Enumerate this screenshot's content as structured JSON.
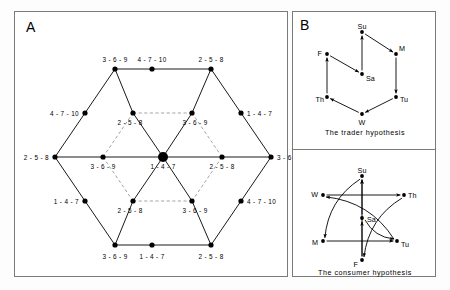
{
  "figure": {
    "panels": [
      {
        "letter": "A",
        "name": "market-ring-network"
      },
      {
        "letter": "B",
        "name": "weekday-cycle-hypotheses"
      }
    ]
  },
  "panelA": {
    "letter": "A",
    "nodes": [
      {
        "id": "n-top-left",
        "x": 100,
        "y": 57,
        "label": "3 - 6 - 9",
        "size": "small",
        "lx": 100,
        "ly": 44,
        "align": "c"
      },
      {
        "id": "n-top-mid",
        "x": 137,
        "y": 57,
        "label": "4 - 7 - 10",
        "size": "small",
        "lx": 137,
        "ly": 44,
        "align": "c"
      },
      {
        "id": "n-top-right",
        "x": 196,
        "y": 57,
        "label": "2 - 5 - 8",
        "size": "small",
        "lx": 196,
        "ly": 44,
        "align": "c"
      },
      {
        "id": "n-upper-left-mid",
        "x": 70,
        "y": 101,
        "label": "4 - 7 - 10",
        "size": "small",
        "lx": 64,
        "ly": 98,
        "align": "r"
      },
      {
        "id": "n-upper-right-mid",
        "x": 226,
        "y": 101,
        "label": "1 - 4 - 7",
        "size": "small",
        "lx": 232,
        "ly": 98,
        "align": "l"
      },
      {
        "id": "n-left",
        "x": 40,
        "y": 145,
        "label": "2 - 5 - 8",
        "size": "small",
        "lx": 34,
        "ly": 142,
        "align": "r"
      },
      {
        "id": "n-right",
        "x": 256,
        "y": 145,
        "label": "3 - 6 - 9",
        "size": "small",
        "lx": 262,
        "ly": 142,
        "align": "l"
      },
      {
        "id": "n-lower-left-mid",
        "x": 70,
        "y": 189,
        "label": "1 - 4 - 7",
        "size": "small",
        "lx": 64,
        "ly": 186,
        "align": "r"
      },
      {
        "id": "n-lower-right-mid",
        "x": 226,
        "y": 189,
        "label": "4 - 7 - 10",
        "size": "small",
        "lx": 232,
        "ly": 186,
        "align": "l"
      },
      {
        "id": "n-bot-left",
        "x": 100,
        "y": 233,
        "label": "3 - 6 - 9",
        "size": "small",
        "lx": 100,
        "ly": 241,
        "align": "c"
      },
      {
        "id": "n-bot-mid",
        "x": 137,
        "y": 233,
        "label": "1 - 4 - 7",
        "size": "small",
        "lx": 137,
        "ly": 241,
        "align": "c"
      },
      {
        "id": "n-bot-right",
        "x": 196,
        "y": 233,
        "label": "2 - 5 - 8",
        "size": "small",
        "lx": 196,
        "ly": 241,
        "align": "c"
      },
      {
        "id": "n-inner-top-left",
        "x": 118,
        "y": 101,
        "label": "2 - 5 - 8",
        "size": "small",
        "lx": 115,
        "ly": 107,
        "align": "c"
      },
      {
        "id": "n-inner-top-right",
        "x": 177,
        "y": 101,
        "label": "3 - 6 - 9",
        "size": "small",
        "lx": 180,
        "ly": 107,
        "align": "c"
      },
      {
        "id": "n-mid-left",
        "x": 88,
        "y": 145,
        "label": "3 - 6 - 9",
        "size": "small",
        "lx": 88,
        "ly": 151,
        "align": "c"
      },
      {
        "id": "n-center",
        "x": 148,
        "y": 145,
        "label": "1 - 4 - 7",
        "size": "large",
        "lx": 148,
        "ly": 151,
        "align": "c"
      },
      {
        "id": "n-mid-right",
        "x": 207,
        "y": 145,
        "label": "2 - 5 - 8",
        "size": "small",
        "lx": 207,
        "ly": 151,
        "align": "c"
      },
      {
        "id": "n-inner-bot-left",
        "x": 118,
        "y": 189,
        "label": "2 - 5 - 8",
        "size": "small",
        "lx": 115,
        "ly": 195,
        "align": "c"
      },
      {
        "id": "n-inner-bot-right",
        "x": 177,
        "y": 189,
        "label": "3 - 6 - 9",
        "size": "small",
        "lx": 180,
        "ly": 195,
        "align": "c"
      }
    ],
    "solid_edges": [
      [
        100,
        57,
        196,
        57
      ],
      [
        40,
        145,
        100,
        233
      ],
      [
        40,
        145,
        100,
        57
      ],
      [
        256,
        145,
        196,
        57
      ],
      [
        256,
        145,
        196,
        233
      ],
      [
        100,
        233,
        196,
        233
      ],
      [
        100,
        57,
        118,
        101
      ],
      [
        118,
        101,
        148,
        145
      ],
      [
        148,
        145,
        177,
        101
      ],
      [
        177,
        101,
        196,
        57
      ],
      [
        100,
        233,
        118,
        189
      ],
      [
        118,
        189,
        148,
        145
      ],
      [
        148,
        145,
        177,
        189
      ],
      [
        177,
        189,
        196,
        233
      ],
      [
        88,
        145,
        256,
        145
      ],
      [
        40,
        145,
        88,
        145
      ]
    ],
    "dashed_edges": [
      [
        118,
        101,
        177,
        101
      ],
      [
        118,
        189,
        177,
        189
      ],
      [
        88,
        145,
        118,
        101
      ],
      [
        88,
        145,
        118,
        189
      ],
      [
        207,
        145,
        177,
        101
      ],
      [
        207,
        145,
        177,
        189
      ]
    ]
  },
  "panelB": {
    "letter": "B",
    "trader": {
      "caption": "The trader hypothesis",
      "nodes": [
        {
          "id": "su",
          "label": "Su",
          "x": 69,
          "y": 20,
          "lx": 69,
          "ly": 11,
          "align": "c"
        },
        {
          "id": "m",
          "label": "M",
          "x": 103,
          "y": 42,
          "lx": 106,
          "ly": 33,
          "align": "l"
        },
        {
          "id": "tu",
          "label": "Tu",
          "x": 103,
          "y": 85,
          "lx": 107,
          "ly": 84,
          "align": "l"
        },
        {
          "id": "w",
          "label": "W",
          "x": 69,
          "y": 102,
          "lx": 69,
          "ly": 107,
          "align": "c"
        },
        {
          "id": "th",
          "label": "Th",
          "x": 34,
          "y": 85,
          "lx": 31,
          "ly": 84,
          "align": "r"
        },
        {
          "id": "f",
          "label": "F",
          "x": 34,
          "y": 42,
          "lx": 29,
          "ly": 38,
          "align": "r"
        },
        {
          "id": "sa",
          "label": "Sa",
          "x": 69,
          "y": 62,
          "lx": 73,
          "ly": 63,
          "align": "l"
        }
      ],
      "arrows": [
        {
          "from": "sa",
          "to": "su",
          "type": "straight"
        },
        {
          "from": "su",
          "to": "m",
          "type": "straight"
        },
        {
          "from": "m",
          "to": "tu",
          "type": "straight"
        },
        {
          "from": "tu",
          "to": "w",
          "type": "straight"
        },
        {
          "from": "w",
          "to": "th",
          "type": "straight"
        },
        {
          "from": "th",
          "to": "f",
          "type": "straight"
        },
        {
          "from": "f",
          "to": "sa",
          "type": "straight"
        }
      ]
    },
    "consumer": {
      "caption": "The consumer hypothesis",
      "nodes": [
        {
          "id": "su",
          "label": "Su",
          "x": 69,
          "y": 26,
          "lx": 69,
          "ly": 17,
          "align": "c"
        },
        {
          "id": "th",
          "label": "Th",
          "x": 111,
          "y": 45,
          "lx": 115,
          "ly": 42,
          "align": "l"
        },
        {
          "id": "tu",
          "label": "Tu",
          "x": 104,
          "y": 91,
          "lx": 108,
          "ly": 91,
          "align": "l"
        },
        {
          "id": "f",
          "label": "F",
          "x": 69,
          "y": 110,
          "lx": 65,
          "ly": 111,
          "align": "r"
        },
        {
          "id": "m",
          "label": "M",
          "x": 30,
          "y": 91,
          "lx": 25,
          "ly": 89,
          "align": "r"
        },
        {
          "id": "w",
          "label": "W",
          "x": 30,
          "y": 45,
          "lx": 25,
          "ly": 41,
          "align": "r"
        },
        {
          "id": "sa",
          "label": "Sa",
          "x": 69,
          "y": 68,
          "lx": 74,
          "ly": 66,
          "align": "l"
        }
      ],
      "arrows": [
        {
          "from": "f",
          "to": "su",
          "type": "straight"
        },
        {
          "from": "w",
          "to": "th",
          "type": "straight"
        },
        {
          "from": "m",
          "to": "tu",
          "type": "straight"
        },
        {
          "from": "f",
          "to": "sa",
          "type": "straight"
        },
        {
          "from": "sa",
          "to": "su",
          "type": "straight"
        },
        {
          "from": "su",
          "to": "m",
          "type": "curved"
        },
        {
          "from": "th",
          "to": "f",
          "type": "curved"
        },
        {
          "from": "tu",
          "to": "w",
          "type": "curved"
        },
        {
          "from": "sa",
          "to": "tu",
          "type": "curved"
        }
      ]
    }
  }
}
